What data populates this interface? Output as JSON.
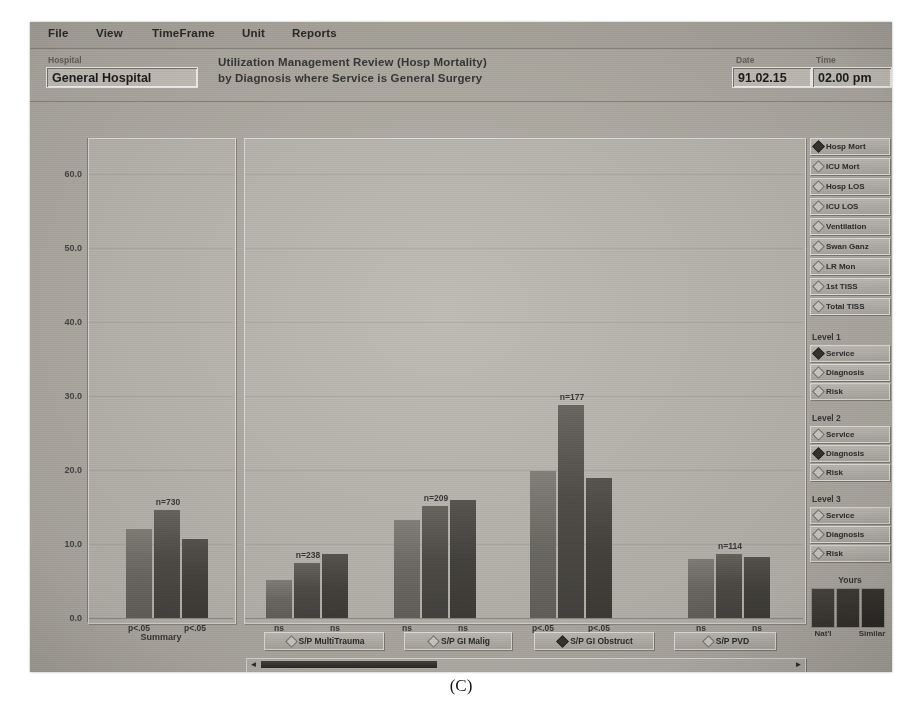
{
  "menu": {
    "items": [
      {
        "label": "File",
        "x": 18
      },
      {
        "label": "View",
        "x": 66
      },
      {
        "label": "TimeFrame",
        "x": 122
      },
      {
        "label": "Unit",
        "x": 212
      },
      {
        "label": "Reports",
        "x": 262
      }
    ]
  },
  "header": {
    "hospital_label": "Hospital",
    "hospital_value": "General Hospital",
    "title_line1": "Utilization Management Review (Hosp Mortality)",
    "title_line2": "by Diagnosis where Service is General Surgery",
    "date_label": "Date",
    "date_value": "91.02.15",
    "time_label": "Time",
    "time_value": "02.00 pm"
  },
  "measures": {
    "items": [
      {
        "label": "Hosp Mort",
        "selected": true
      },
      {
        "label": "ICU Mort",
        "selected": false
      },
      {
        "label": "Hosp LOS",
        "selected": false
      },
      {
        "label": "ICU LOS",
        "selected": false
      },
      {
        "label": "Ventilation",
        "selected": false
      },
      {
        "label": "Swan Ganz",
        "selected": false
      },
      {
        "label": "LR Mon",
        "selected": false
      },
      {
        "label": "1st TISS",
        "selected": false
      },
      {
        "label": "Total TISS",
        "selected": false
      }
    ]
  },
  "levels": [
    {
      "title": "Level 1",
      "options": [
        {
          "label": "Service",
          "selected": true
        },
        {
          "label": "Diagnosis",
          "selected": false
        },
        {
          "label": "Risk",
          "selected": false
        }
      ]
    },
    {
      "title": "Level 2",
      "options": [
        {
          "label": "Service",
          "selected": false
        },
        {
          "label": "Diagnosis",
          "selected": true
        },
        {
          "label": "Risk",
          "selected": false
        }
      ]
    },
    {
      "title": "Level 3",
      "options": [
        {
          "label": "Service",
          "selected": false
        },
        {
          "label": "Diagnosis",
          "selected": false
        },
        {
          "label": "Risk",
          "selected": false
        }
      ]
    }
  ],
  "legend": {
    "title": "Yours",
    "left_caption": "Nat'l",
    "right_caption": "Similar",
    "series": [
      "Nat'l",
      "Yours",
      "Similar"
    ],
    "colors": {
      "yours": "#4a4743",
      "natl": "#74716b",
      "similar": "#3e3b36"
    }
  },
  "diagnosis_buttons": [
    {
      "label": "S/P MultiTrauma",
      "selected": false,
      "x": 18,
      "w": 118
    },
    {
      "label": "S/P GI Malig",
      "selected": false,
      "x": 158,
      "w": 106
    },
    {
      "label": "S/P GI Obstruct",
      "selected": true,
      "x": 288,
      "w": 118
    },
    {
      "label": "S/P PVD",
      "selected": false,
      "x": 428,
      "w": 100
    }
  ],
  "scrollbar": {
    "left_arrow": "◄",
    "right_arrow": "►"
  },
  "caption": "(C)",
  "chart_data": {
    "type": "bar",
    "title": "Utilization Management Review (Hosp Mortality) by Diagnosis where Service is General Surgery",
    "xlabel": "",
    "ylabel": "",
    "ylim": [
      0,
      60
    ],
    "yticks": [
      "0.0",
      "10.0",
      "20.0",
      "30.0",
      "40.0",
      "50.0",
      "60.0"
    ],
    "ytick_values": [
      0,
      10,
      20,
      30,
      40,
      50,
      60
    ],
    "grid": true,
    "legend_position": "right",
    "series": [
      {
        "name": "Nat'l",
        "values": [
          12.0,
          5.1,
          13.2,
          19.9,
          8.0
        ]
      },
      {
        "name": "Yours",
        "values": [
          14.6,
          7.4,
          15.2,
          28.8,
          8.6
        ]
      },
      {
        "name": "Similar",
        "values": [
          10.7,
          8.6,
          16.0,
          18.9,
          8.2
        ]
      }
    ],
    "groups": [
      {
        "category": "Summary",
        "n_label": "",
        "panel": "summary",
        "sig_left": "p<.05",
        "sig_right": "p<.05"
      },
      {
        "category": "S/P MultiTrauma",
        "n_label": "n=238",
        "panel": "main",
        "sig_left": "ns",
        "sig_right": "ns"
      },
      {
        "category": "S/P GI Malig",
        "n_label": "n=209",
        "panel": "main",
        "sig_left": "ns",
        "sig_right": "ns"
      },
      {
        "category": "S/P GI Obstruct",
        "n_label": "n=177",
        "panel": "main",
        "sig_left": "p<.05",
        "sig_right": "p<.05"
      },
      {
        "category": "S/P PVD",
        "n_label": "n=114",
        "panel": "main",
        "sig_left": "ns",
        "sig_right": "ns"
      }
    ],
    "summary_n_label": "n=730",
    "summary_label": "Summary"
  }
}
